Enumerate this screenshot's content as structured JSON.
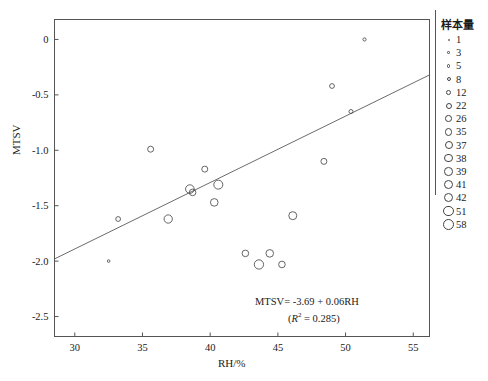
{
  "chart_data": {
    "type": "scatter",
    "title": "",
    "xlabel": "RH/%",
    "ylabel": "MTSV",
    "xlim": [
      28.5,
      56.2
    ],
    "ylim": [
      -2.68,
      0.18
    ],
    "xticks": [
      "30",
      "35",
      "40",
      "45",
      "50",
      "55"
    ],
    "xtick_values": [
      30,
      35,
      40,
      45,
      50,
      55
    ],
    "yticks": [
      "0",
      "-0.5",
      "-1.0",
      "-1.5",
      "-2.0",
      "-2.5"
    ],
    "ytick_values": [
      0,
      -0.5,
      -1.0,
      -1.5,
      -2.0,
      -2.5
    ],
    "grid": false,
    "legend_position": "right-outside",
    "annotations": {
      "equation": "MTSV= -3.69 + 0.06RH",
      "r_squared_prefix": "(",
      "r_squared_text": "R",
      "r_squared_sup": "2",
      "r_squared_value": " = 0.285)"
    },
    "regression_line": {
      "intercept": -3.69,
      "slope": 0.06,
      "x_start": 28.5,
      "x_end": 56.2,
      "y_start": -1.98,
      "y_end": -0.32
    },
    "points": [
      {
        "x": 32.5,
        "y": -2.0,
        "n": 3
      },
      {
        "x": 33.2,
        "y": -1.62,
        "n": 12
      },
      {
        "x": 35.6,
        "y": -0.99,
        "n": 22
      },
      {
        "x": 36.9,
        "y": -1.62,
        "n": 38
      },
      {
        "x": 38.5,
        "y": -1.35,
        "n": 39
      },
      {
        "x": 38.7,
        "y": -1.38,
        "n": 26
      },
      {
        "x": 39.6,
        "y": -1.17,
        "n": 22
      },
      {
        "x": 40.3,
        "y": -1.47,
        "n": 35
      },
      {
        "x": 40.6,
        "y": -1.31,
        "n": 41
      },
      {
        "x": 42.6,
        "y": -1.93,
        "n": 26
      },
      {
        "x": 43.6,
        "y": -2.03,
        "n": 42
      },
      {
        "x": 44.4,
        "y": -1.93,
        "n": 35
      },
      {
        "x": 45.3,
        "y": -2.03,
        "n": 26
      },
      {
        "x": 46.1,
        "y": -1.59,
        "n": 37
      },
      {
        "x": 48.4,
        "y": -1.1,
        "n": 22
      },
      {
        "x": 49.0,
        "y": -0.42,
        "n": 12
      },
      {
        "x": 50.4,
        "y": -0.65,
        "n": 8
      },
      {
        "x": 51.4,
        "y": 0.0,
        "n": 5
      }
    ]
  },
  "legend": {
    "title": "样本量",
    "entries": [
      {
        "label": "1",
        "size": 2.0
      },
      {
        "label": "3",
        "size": 2.6
      },
      {
        "label": "5",
        "size": 3.2
      },
      {
        "label": "8",
        "size": 4.0
      },
      {
        "label": "12",
        "size": 4.8
      },
      {
        "label": "22",
        "size": 6.0
      },
      {
        "label": "26",
        "size": 6.6
      },
      {
        "label": "35",
        "size": 7.6
      },
      {
        "label": "37",
        "size": 8.0
      },
      {
        "label": "38",
        "size": 8.3
      },
      {
        "label": "39",
        "size": 8.6
      },
      {
        "label": "41",
        "size": 9.0
      },
      {
        "label": "42",
        "size": 9.3
      },
      {
        "label": "51",
        "size": 10.2
      },
      {
        "label": "58",
        "size": 11.0
      }
    ]
  },
  "style": {
    "axis_color": "#555555",
    "point_color": "#4a4a4a",
    "line_color": "#5a5a5a",
    "text_color": "#1a1a1a",
    "background": "#ffffff"
  }
}
